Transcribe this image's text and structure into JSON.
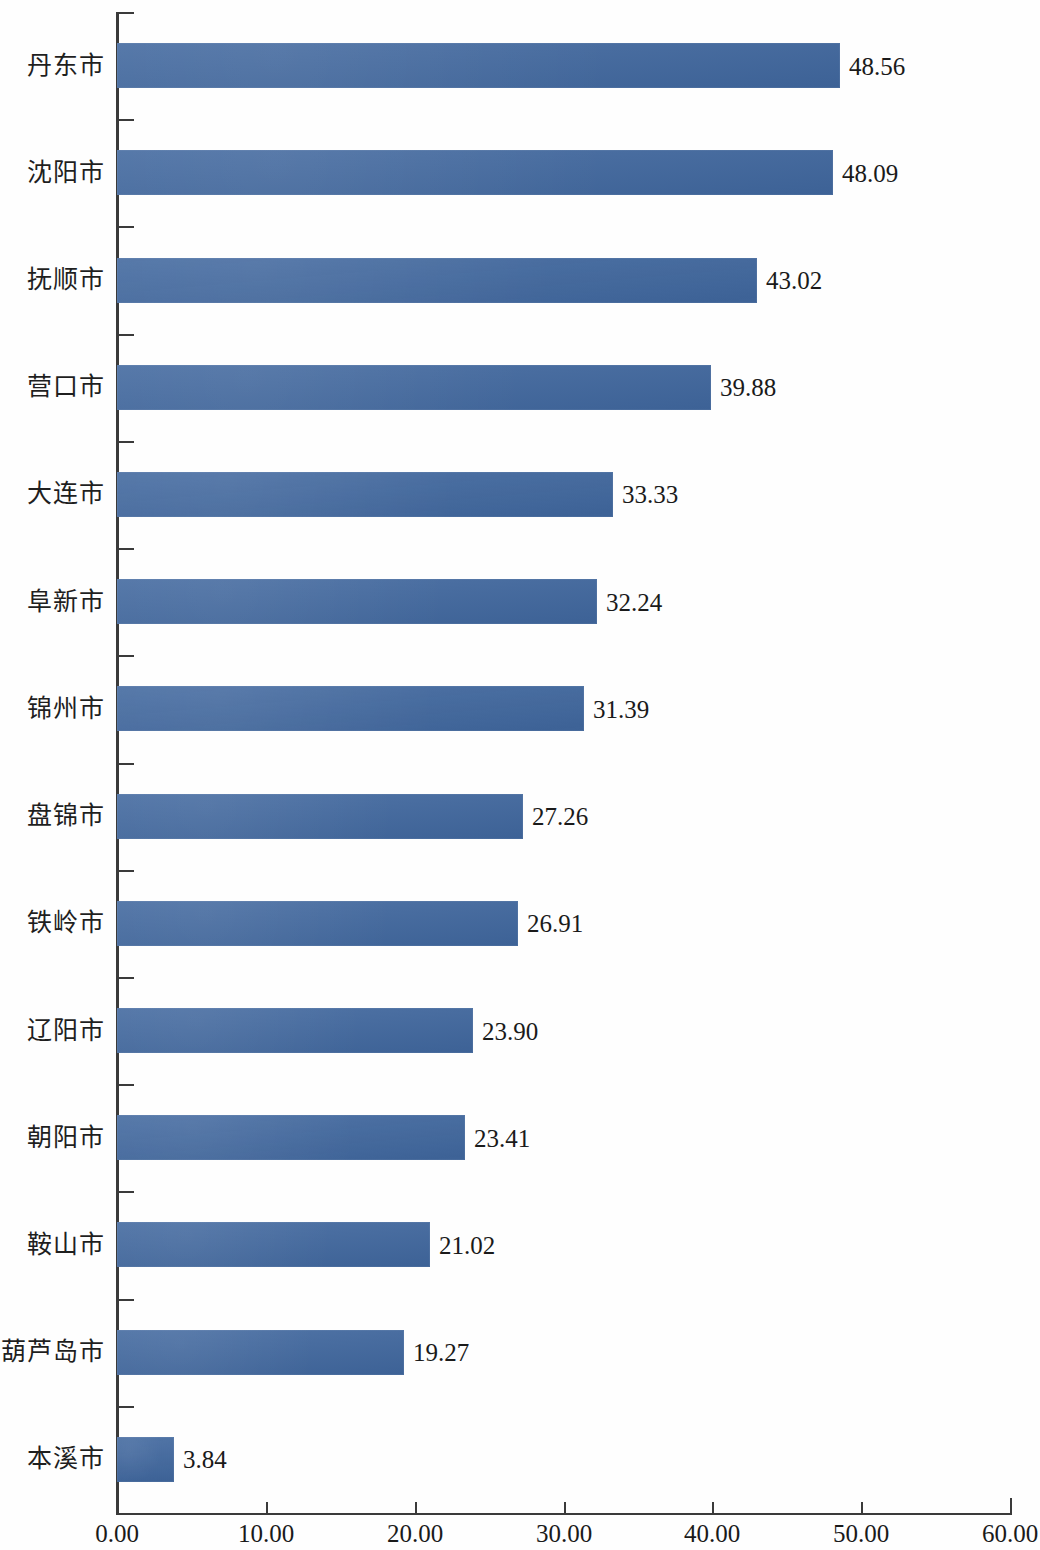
{
  "chart_data": {
    "type": "bar",
    "orientation": "horizontal",
    "title": "",
    "subtitle": "",
    "xlabel": "",
    "ylabel": "",
    "xlim": [
      0,
      60
    ],
    "ylim": null,
    "grid": false,
    "legend": null,
    "legend_position": "none",
    "bar_color": "#40679E",
    "axis_color": "#3A3A3A",
    "x_ticks": [
      "0.00",
      "10.00",
      "20.00",
      "30.00",
      "40.00",
      "50.00",
      "60.00"
    ],
    "x_tick_values": [
      0,
      10,
      20,
      30,
      40,
      50,
      60
    ],
    "categories": [
      "丹东市",
      "沈阳市",
      "抚顺市",
      "营口市",
      "大连市",
      "阜新市",
      "锦州市",
      "盘锦市",
      "铁岭市",
      "辽阳市",
      "朝阳市",
      "鞍山市",
      "葫芦岛市",
      "本溪市"
    ],
    "values": [
      48.56,
      48.09,
      43.02,
      39.88,
      33.33,
      32.24,
      31.39,
      27.26,
      26.91,
      23.9,
      23.41,
      21.02,
      19.27,
      3.84
    ],
    "value_labels": [
      "48.56",
      "48.09",
      "43.02",
      "39.88",
      "33.33",
      "32.24",
      "31.39",
      "27.26",
      "26.91",
      "23.90",
      "23.41",
      "21.02",
      "19.27",
      "3.84"
    ],
    "series": [
      {
        "name": "",
        "values": [
          48.56,
          48.09,
          43.02,
          39.88,
          33.33,
          32.24,
          31.39,
          27.26,
          26.91,
          23.9,
          23.41,
          21.02,
          19.27,
          3.84
        ]
      }
    ]
  }
}
